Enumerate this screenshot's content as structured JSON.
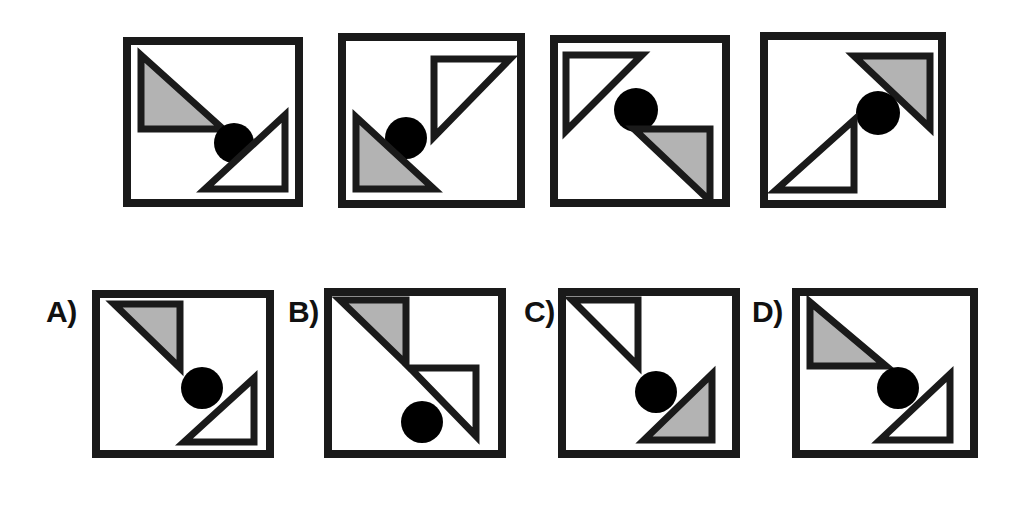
{
  "puzzle": {
    "type": "visual-analogy-matrix",
    "colors": {
      "stroke": "#1a1a1a",
      "fill_gray": "#b3b3b3",
      "fill_white": "#ffffff",
      "circle": "#000000",
      "background": "#ffffff"
    },
    "sequence_row": {
      "name": "sequence",
      "panels": [
        {
          "id": "seq-1",
          "x": 123,
          "y": 37,
          "w": 180,
          "h": 170,
          "shapes": [
            {
              "kind": "triangle",
              "name": "gray-triangle",
              "fill": "gray",
              "right_angle": "bottom-left",
              "pts": "18,18 18,92 100,92"
            },
            {
              "kind": "circle",
              "name": "black-circle",
              "cx": 111,
              "cy": 106,
              "r": 20
            },
            {
              "kind": "triangle",
              "name": "white-triangle",
              "fill": "white",
              "right_angle": "bottom-right",
              "pts": "162,78 162,152 82,152"
            }
          ]
        },
        {
          "id": "seq-2",
          "x": 338,
          "y": 33,
          "w": 187,
          "h": 175,
          "shapes": [
            {
              "kind": "triangle",
              "name": "white-triangle",
              "fill": "white",
              "right_angle": "top-left",
              "pts": "96,26 172,26 96,104"
            },
            {
              "kind": "circle",
              "name": "black-circle",
              "cx": 68,
              "cy": 105,
              "r": 21
            },
            {
              "kind": "triangle",
              "name": "gray-triangle",
              "fill": "gray",
              "right_angle": "bottom-left",
              "pts": "18,84 18,156 96,156"
            }
          ]
        },
        {
          "id": "seq-3",
          "x": 550,
          "y": 35,
          "w": 180,
          "h": 172,
          "shapes": [
            {
              "kind": "triangle",
              "name": "white-triangle",
              "fill": "white",
              "right_angle": "top-left",
              "pts": "16,20 92,20 16,96"
            },
            {
              "kind": "circle",
              "name": "black-circle",
              "cx": 86,
              "cy": 75,
              "r": 22
            },
            {
              "kind": "triangle",
              "name": "gray-triangle",
              "fill": "gray",
              "right_angle": "top-right",
              "pts": "84,94 160,94 160,166"
            }
          ]
        },
        {
          "id": "seq-4",
          "x": 760,
          "y": 32,
          "w": 186,
          "h": 176,
          "shapes": [
            {
              "kind": "triangle",
              "name": "gray-triangle",
              "fill": "gray",
              "right_angle": "top-right",
              "pts": "94,24 170,24 170,96"
            },
            {
              "kind": "circle",
              "name": "black-circle",
              "cx": 118,
              "cy": 81,
              "r": 22
            },
            {
              "kind": "triangle",
              "name": "white-triangle",
              "fill": "white",
              "right_angle": "bottom-right",
              "pts": "94,88 94,158 16,158"
            }
          ]
        }
      ]
    },
    "options_row": {
      "name": "answer-options",
      "options": [
        {
          "id": "option-a",
          "label": "A)",
          "label_x": 46,
          "label_y": 297,
          "x": 92,
          "y": 290,
          "w": 182,
          "h": 168,
          "shapes": [
            {
              "kind": "triangle",
              "name": "gray-triangle",
              "fill": "gray",
              "right_angle": "top-right",
              "pts": "22,14 88,14 88,78"
            },
            {
              "kind": "circle",
              "name": "black-circle",
              "cx": 110,
              "cy": 98,
              "r": 21
            },
            {
              "kind": "triangle",
              "name": "white-triangle",
              "fill": "white",
              "right_angle": "bottom-right",
              "pts": "162,88 162,152 92,152"
            }
          ]
        },
        {
          "id": "option-b",
          "label": "B)",
          "label_x": 288,
          "label_y": 297,
          "x": 324,
          "y": 288,
          "w": 182,
          "h": 170,
          "shapes": [
            {
              "kind": "triangle",
              "name": "gray-triangle",
              "fill": "gray",
              "right_angle": "top-right",
              "pts": "16,12 82,12 82,76"
            },
            {
              "kind": "triangle",
              "name": "white-triangle",
              "fill": "white",
              "right_angle": "top-right",
              "pts": "86,80 152,80 152,148"
            },
            {
              "kind": "circle",
              "name": "black-circle",
              "cx": 98,
              "cy": 134,
              "r": 21
            }
          ]
        },
        {
          "id": "option-c",
          "label": "C)",
          "label_x": 524,
          "label_y": 297,
          "x": 558,
          "y": 288,
          "w": 182,
          "h": 170,
          "shapes": [
            {
              "kind": "triangle",
              "name": "white-triangle",
              "fill": "white",
              "right_angle": "top-right",
              "pts": "14,12 80,12 80,78"
            },
            {
              "kind": "circle",
              "name": "black-circle",
              "cx": 98,
              "cy": 104,
              "r": 21
            },
            {
              "kind": "triangle",
              "name": "gray-triangle",
              "fill": "gray",
              "right_angle": "bottom-right",
              "pts": "154,86 154,152 86,152"
            }
          ]
        },
        {
          "id": "option-d",
          "label": "D)",
          "label_x": 752,
          "label_y": 297,
          "x": 792,
          "y": 288,
          "w": 186,
          "h": 170,
          "shapes": [
            {
              "kind": "triangle",
              "name": "gray-triangle",
              "fill": "gray",
              "right_angle": "top-left",
              "pts": "18,14 18,78 94,78"
            },
            {
              "kind": "circle",
              "name": "black-circle",
              "cx": 106,
              "cy": 100,
              "r": 21
            },
            {
              "kind": "triangle",
              "name": "white-triangle",
              "fill": "white",
              "right_angle": "bottom-right",
              "pts": "158,86 158,152 88,152"
            }
          ]
        }
      ]
    }
  }
}
